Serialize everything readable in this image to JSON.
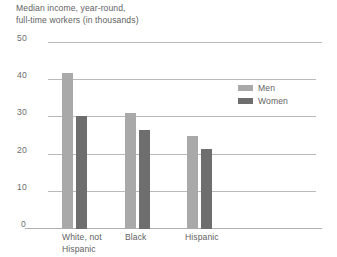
{
  "chart_data": {
    "type": "bar",
    "title_line1": "Median income, year-round,",
    "title_line2": "full-time workers (in thousands)",
    "xlabel": "",
    "ylabel": "",
    "ylim": [
      0,
      50
    ],
    "yticks": [
      0,
      10,
      20,
      30,
      40,
      50
    ],
    "ytick_labels": [
      "0",
      "10",
      "20",
      "30",
      "40",
      "50"
    ],
    "grid": true,
    "legend_position": "upper right",
    "categories": [
      "White, not Hispanic",
      "Black",
      "Hispanic"
    ],
    "category_lines": [
      [
        "White, not",
        "Hispanic"
      ],
      [
        "Black"
      ],
      [
        "Hispanic"
      ]
    ],
    "series": [
      {
        "name": "Men",
        "color": "#a9a9a9",
        "values": [
          42.0,
          31.2,
          25.0
        ]
      },
      {
        "name": "Women",
        "color": "#6e6e6e",
        "values": [
          30.3,
          26.7,
          21.4
        ]
      }
    ]
  },
  "legend": {
    "men_label": "Men",
    "women_label": "Women"
  },
  "axis": {
    "tick_50": "50",
    "tick_40": "40",
    "tick_30": "30",
    "tick_20": "20",
    "tick_10": "10",
    "tick_0": "0"
  },
  "categories": {
    "white_line1": "White, not",
    "white_line2": "Hispanic",
    "black": "Black",
    "hispanic": "Hispanic"
  }
}
